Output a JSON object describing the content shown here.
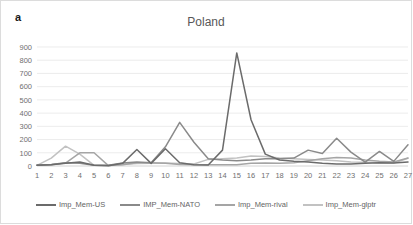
{
  "panel": {
    "label": "a"
  },
  "chart_data": {
    "type": "line",
    "title": "Poland",
    "xlabel": "",
    "ylabel": "",
    "xlim": [
      1,
      27
    ],
    "ylim": [
      0,
      900
    ],
    "grid": true,
    "legend_position": "bottom",
    "categories": [
      1,
      2,
      3,
      4,
      5,
      6,
      7,
      8,
      9,
      10,
      11,
      12,
      13,
      14,
      15,
      16,
      17,
      18,
      19,
      20,
      21,
      22,
      23,
      24,
      25,
      26,
      27
    ],
    "xtick_labels": [
      "1",
      "2",
      "3",
      "4",
      "5",
      "6",
      "7",
      "8",
      "9",
      "10",
      "11",
      "12",
      "13",
      "14",
      "15",
      "16",
      "17",
      "18",
      "19",
      "20",
      "21",
      "22",
      "23",
      "24",
      "25",
      "26",
      "27"
    ],
    "ytick_labels": [
      "0",
      "100",
      "200",
      "300",
      "400",
      "500",
      "600",
      "700",
      "800",
      "900"
    ],
    "ytick_values": [
      0,
      100,
      200,
      300,
      400,
      500,
      600,
      700,
      800,
      900
    ],
    "series": [
      {
        "name": "Imp_Mem-US",
        "color": "#6b6b6b",
        "values": [
          5,
          10,
          20,
          30,
          5,
          2,
          20,
          125,
          20,
          130,
          25,
          10,
          8,
          120,
          855,
          350,
          90,
          45,
          35,
          30,
          20,
          15,
          15,
          20,
          25,
          22,
          30
        ]
      },
      {
        "name": "IMP_Mem-NATO",
        "color": "#8a8a8a",
        "values": [
          8,
          12,
          25,
          20,
          5,
          5,
          22,
          30,
          25,
          145,
          330,
          180,
          55,
          45,
          40,
          45,
          55,
          55,
          60,
          120,
          95,
          210,
          105,
          30,
          110,
          35,
          160
        ]
      },
      {
        "name": "Imp_Mem-rival",
        "color": "#a5a5a5",
        "values": [
          5,
          10,
          22,
          100,
          100,
          3,
          10,
          25,
          25,
          20,
          12,
          10,
          10,
          10,
          10,
          20,
          22,
          20,
          25,
          40,
          55,
          65,
          60,
          45,
          35,
          30,
          60
        ]
      },
      {
        "name": "Imp_Mem-glptr",
        "color": "#c2c2c2",
        "values": [
          5,
          60,
          150,
          90,
          5,
          3,
          12,
          18,
          20,
          22,
          18,
          15,
          50,
          55,
          60,
          75,
          72,
          60,
          55,
          50,
          45,
          40,
          30,
          28,
          25,
          22,
          58
        ]
      }
    ]
  }
}
